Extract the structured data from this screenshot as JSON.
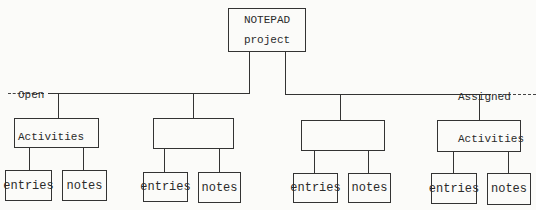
{
  "root": {
    "line1": "NOTEPAD",
    "line2": "project"
  },
  "branches": {
    "left_label_line1": "Open",
    "left_label_line2": "Activities",
    "right_label_line1": "Assigned",
    "right_label_line2": "Activities"
  },
  "groups": [
    {
      "entries": "entries",
      "notes": "notes"
    },
    {
      "entries": "entries",
      "notes": "notes"
    },
    {
      "entries": "entries",
      "notes": "notes"
    },
    {
      "entries": "entries",
      "notes": "notes"
    }
  ]
}
